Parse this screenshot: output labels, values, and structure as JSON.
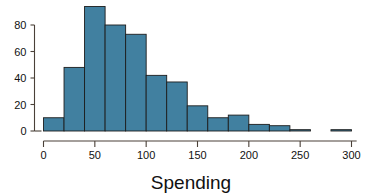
{
  "chart_data": {
    "type": "bar",
    "title": "",
    "subtitle": "",
    "xlabel": "Spending",
    "ylabel": "",
    "xlim": [
      0,
      305
    ],
    "ylim": [
      0,
      96
    ],
    "grid": false,
    "legend": null,
    "bin_width": 20,
    "bar_fill_color": "#4180a0",
    "bar_edge_color": "#1d1d1d",
    "axis_color": "#4a4038",
    "x_ticks": [
      0,
      50,
      100,
      150,
      200,
      250,
      300
    ],
    "x_tick_labels": [
      "0",
      "50",
      "100",
      "150",
      "200",
      "250",
      "300"
    ],
    "y_ticks": [
      0,
      20,
      40,
      60,
      80
    ],
    "y_tick_labels": [
      "0",
      "20",
      "40",
      "60",
      "80"
    ],
    "bins": [
      {
        "x0": 0,
        "x1": 20,
        "label": "0-20",
        "value": 10
      },
      {
        "x0": 20,
        "x1": 40,
        "label": "20-40",
        "value": 48
      },
      {
        "x0": 40,
        "x1": 60,
        "label": "40-60",
        "value": 94
      },
      {
        "x0": 60,
        "x1": 80,
        "label": "60-80",
        "value": 80
      },
      {
        "x0": 80,
        "x1": 100,
        "label": "80-100",
        "value": 73
      },
      {
        "x0": 100,
        "x1": 120,
        "label": "100-120",
        "value": 42
      },
      {
        "x0": 120,
        "x1": 140,
        "label": "120-140",
        "value": 37
      },
      {
        "x0": 140,
        "x1": 160,
        "label": "140-160",
        "value": 19
      },
      {
        "x0": 160,
        "x1": 180,
        "label": "160-180",
        "value": 10
      },
      {
        "x0": 180,
        "x1": 200,
        "label": "180-200",
        "value": 12
      },
      {
        "x0": 200,
        "x1": 220,
        "label": "200-220",
        "value": 5
      },
      {
        "x0": 220,
        "x1": 240,
        "label": "220-240",
        "value": 4
      },
      {
        "x0": 240,
        "x1": 260,
        "label": "240-260",
        "value": 1
      },
      {
        "x0": 260,
        "x1": 280,
        "label": "260-280",
        "value": 0
      },
      {
        "x0": 280,
        "x1": 300,
        "label": "280-300",
        "value": 1
      }
    ],
    "categories": [
      "0-20",
      "20-40",
      "40-60",
      "60-80",
      "80-100",
      "100-120",
      "120-140",
      "140-160",
      "160-180",
      "180-200",
      "200-220",
      "220-240",
      "240-260",
      "260-280",
      "280-300"
    ],
    "values": [
      10,
      48,
      94,
      80,
      73,
      42,
      37,
      19,
      10,
      12,
      5,
      4,
      1,
      0,
      1
    ]
  }
}
